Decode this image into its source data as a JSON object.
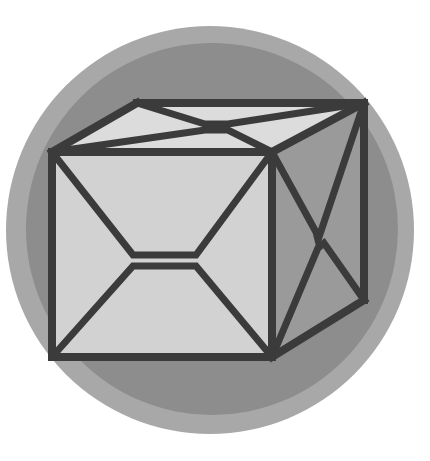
{
  "canvas": {
    "width": 430,
    "height": 461,
    "background": "#ffffff",
    "title": "Cube Emblem"
  },
  "badge": {
    "name": "circular-badge",
    "outer_ring": {
      "label": "outer-ring",
      "color": "#a8a8a8",
      "cx": 210,
      "cy": 230,
      "r": 204
    },
    "inner_disc": {
      "label": "inner-disc",
      "color": "#8d8d8d",
      "cx": 212,
      "cy": 229,
      "r": 186
    }
  },
  "cube": {
    "name": "wireframe-cube",
    "stroke_color": "#3b3b3b",
    "stroke_width": 7,
    "faces": {
      "front": {
        "label": "front-face",
        "fill": "#d2d2d2",
        "points": "52,152 272,152 272,357 52,357"
      },
      "top": {
        "label": "top-face",
        "fill": "#dcdcdc",
        "points": "52,152 137,103 364,103 272,152"
      },
      "right": {
        "label": "right-face",
        "fill": "#9a9a9a",
        "points": "272,152 364,103 364,300 272,357"
      }
    },
    "edges": [
      {
        "label": "edge-front-top",
        "d": "M52,152 L272,152"
      },
      {
        "label": "edge-front-right",
        "d": "M272,152 L272,357"
      },
      {
        "label": "edge-front-bottom",
        "d": "M272,357 L52,357"
      },
      {
        "label": "edge-front-left",
        "d": "M52,357 L52,152"
      },
      {
        "label": "edge-top-back-left",
        "d": "M52,152 L137,103"
      },
      {
        "label": "edge-top-back",
        "d": "M137,103 L364,103"
      },
      {
        "label": "edge-top-right",
        "d": "M364,103 L272,152"
      },
      {
        "label": "edge-right-back",
        "d": "M364,103 L364,300"
      },
      {
        "label": "edge-right-bottom",
        "d": "M364,300 L272,357"
      }
    ],
    "motifs": {
      "front_bowtie": {
        "label": "front-face-bowtie",
        "upper": "M52,152 L133,255 L196,255 L272,152",
        "lower": "M52,357 L133,266 L196,266 L272,357"
      },
      "top_bowtie": {
        "label": "top-face-bowtie",
        "upper": "M137,103 L205,124 L228,124 L364,103",
        "lower": "M52,152 L205,130 L228,130 L272,152"
      },
      "right_bowtie": {
        "label": "right-face-bowtie",
        "upper": "M272,152 L316,232 L318,240 L364,103",
        "lower": "M272,357 L318,248 L324,243 L364,300"
      }
    }
  }
}
